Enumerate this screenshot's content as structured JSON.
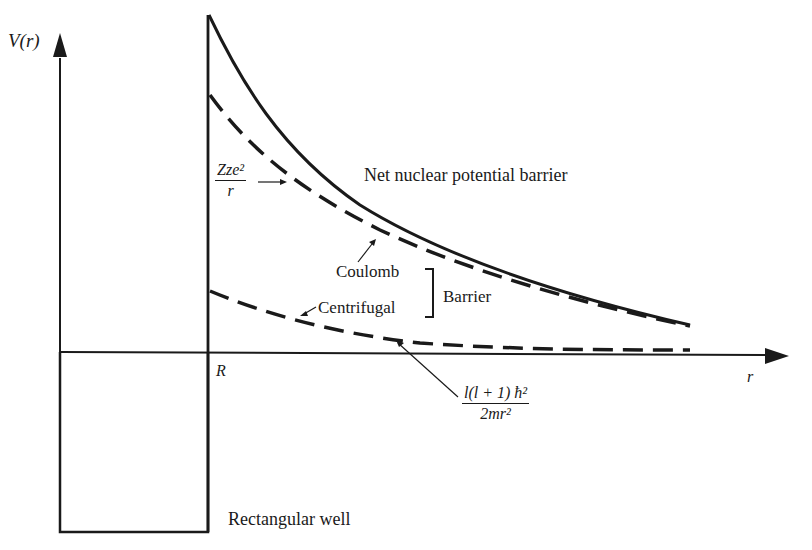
{
  "diagram": {
    "axes": {
      "y_label": "V(r)",
      "x_label": "r",
      "x_tick_label": "R"
    },
    "labels": {
      "net_barrier": "Net nuclear potential barrier",
      "coulomb": "Coulomb",
      "centrifugal": "Centrifugal",
      "barrier_brace": "Barrier",
      "rectangular_well": "Rectangular well"
    },
    "formulas": {
      "coulomb_numerator": "Zze²",
      "coulomb_denominator": "r",
      "centrifugal_numerator": "l(l + 1) ħ²",
      "centrifugal_denominator": "2mr²"
    },
    "curves": [
      {
        "name": "Net nuclear potential barrier",
        "style": "solid"
      },
      {
        "name": "Coulomb",
        "style": "dashed"
      },
      {
        "name": "Centrifugal",
        "style": "dashed"
      }
    ],
    "colors": {
      "ink": "#1a1a1a",
      "background": "#ffffff"
    }
  }
}
